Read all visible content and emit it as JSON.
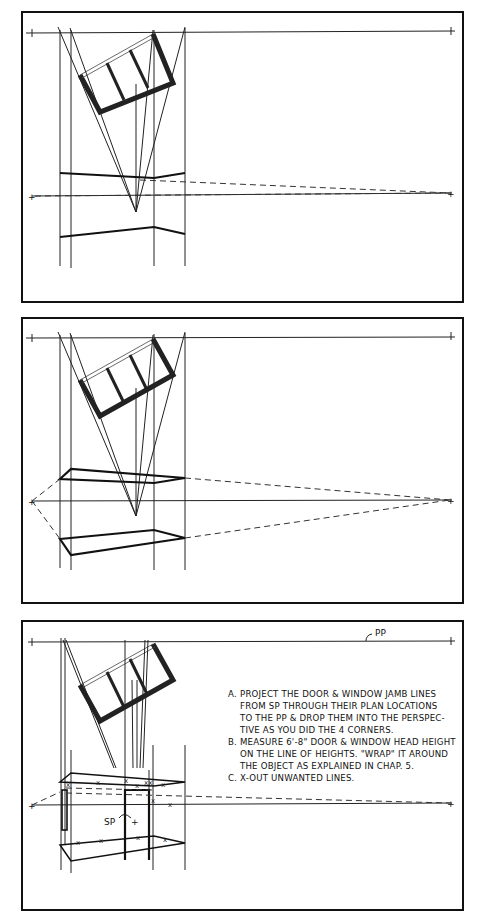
{
  "figure": {
    "panels": [
      {
        "id": "panel-1",
        "description": "Plan with projected corner lines; perspective floor and roof lines drawn between VPs"
      },
      {
        "id": "panel-2",
        "description": "Perspective box closed with dashed lines to left and right vanishing points"
      },
      {
        "id": "panel-3",
        "description": "Door and window jamb lines projected; heights wrapped; unwanted lines X-ed out",
        "labels": {
          "picture_plane": "PP",
          "station_point": "SP"
        },
        "instructions": [
          {
            "letter": "A.",
            "lines": [
              "PROJECT THE DOOR & WINDOW JAMB LINES",
              "FROM SP THROUGH THEIR PLAN LOCATIONS",
              "TO THE PP & DROP THEM INTO THE PERSPEC-",
              "TIVE AS YOU DID THE 4 CORNERS."
            ]
          },
          {
            "letter": "B.",
            "lines": [
              "MEASURE 6'-8\" DOOR & WINDOW HEAD HEIGHT",
              "ON THE LINE OF HEIGHTS. \"WRAP\" IT AROUND",
              "THE OBJECT AS EXPLAINED IN CHAP. 5."
            ]
          },
          {
            "letter": "C.",
            "lines": [
              "X-OUT UNWANTED LINES."
            ]
          }
        ],
        "x_mark": "x"
      }
    ]
  }
}
